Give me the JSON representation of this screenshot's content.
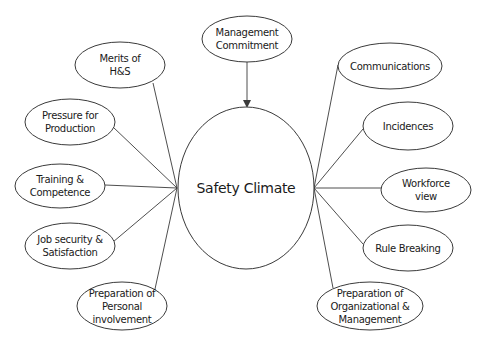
{
  "diagram": {
    "title": "Safety Climate",
    "center": {
      "label": "Safety Climate",
      "cx": 246,
      "cy": 188,
      "rx": 68,
      "ry": 81
    },
    "colors": {
      "stroke": "#3a3a3a",
      "fill": "#ffffff",
      "text": "#1a1a1a"
    },
    "top_node": {
      "label": "Management\nCommitment",
      "cx": 247,
      "cy": 39,
      "rx": 45,
      "ry": 23,
      "relation": "arrow-into-center"
    },
    "left_nodes": [
      {
        "label": "Merits of\nH&S",
        "cx": 120,
        "cy": 65,
        "rx": 45,
        "ry": 23,
        "line_from": [
          153,
          83
        ]
      },
      {
        "label": "Pressure for\nProduction",
        "cx": 70,
        "cy": 122,
        "rx": 45,
        "ry": 23,
        "line_from": [
          113,
          127
        ]
      },
      {
        "label": "Training &\nCompetence",
        "cx": 60,
        "cy": 186,
        "rx": 45,
        "ry": 22,
        "line_from": [
          105,
          185
        ]
      },
      {
        "label": "Job security &\nSatisfaction",
        "cx": 70,
        "cy": 246,
        "rx": 45,
        "ry": 23,
        "line_from": [
          113,
          242
        ]
      },
      {
        "label": "Preparation of\nPersonal\ninvolvement",
        "cx": 122,
        "cy": 306,
        "rx": 45,
        "ry": 24,
        "line_from": [
          155,
          289
        ]
      }
    ],
    "right_nodes": [
      {
        "label": "Communications",
        "cx": 390,
        "cy": 66,
        "rx": 52,
        "ry": 23,
        "line_to": [
          338,
          65
        ]
      },
      {
        "label": "Incidences",
        "cx": 408,
        "cy": 126,
        "rx": 45,
        "ry": 24,
        "line_to": [
          363,
          129
        ]
      },
      {
        "label": "Workforce\nview",
        "cx": 426,
        "cy": 190,
        "rx": 45,
        "ry": 22,
        "line_to": [
          381,
          188
        ]
      },
      {
        "label": "Rule Breaking",
        "cx": 408,
        "cy": 248,
        "rx": 45,
        "ry": 23,
        "line_to": [
          363,
          244
        ]
      },
      {
        "label": "Preparation of\nOrganizational &\nManagement",
        "cx": 370,
        "cy": 306,
        "rx": 53,
        "ry": 24,
        "line_to": [
          333,
          288
        ]
      }
    ],
    "left_hub": [
      177,
      188
    ],
    "right_hub": [
      314,
      188
    ]
  }
}
